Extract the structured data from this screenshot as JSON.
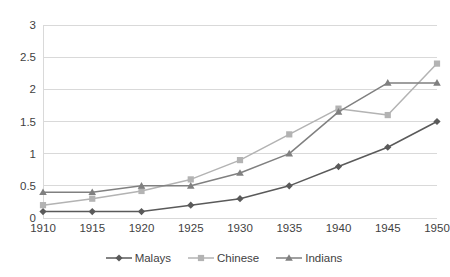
{
  "chart_data": {
    "type": "line",
    "title": "",
    "subtitle": "",
    "xlabel": "",
    "ylabel": "",
    "categories": [
      "1910",
      "1915",
      "1920",
      "1925",
      "1930",
      "1935",
      "1940",
      "1945",
      "1950"
    ],
    "x": [
      1910,
      1915,
      1920,
      1925,
      1930,
      1935,
      1940,
      1945,
      1950
    ],
    "ylim": [
      0,
      3
    ],
    "ytick_labels": [
      "0",
      "0.5",
      "1",
      "1.5",
      "2",
      "2.5",
      "3"
    ],
    "yticks": [
      0,
      0.5,
      1,
      1.5,
      2,
      2.5,
      3
    ],
    "grid": "horizontal",
    "legend_position": "bottom-center",
    "series": [
      {
        "name": "Malays",
        "color": "#5a5a5a",
        "marker": "diamond",
        "values": [
          0.1,
          0.1,
          0.1,
          0.2,
          0.3,
          0.5,
          0.8,
          1.1,
          1.5
        ]
      },
      {
        "name": "Chinese",
        "color": "#b3b3b3",
        "marker": "square",
        "values": [
          0.2,
          0.3,
          0.42,
          0.6,
          0.9,
          1.3,
          1.7,
          1.6,
          2.4
        ]
      },
      {
        "name": "Indians",
        "color": "#808080",
        "marker": "triangle",
        "values": [
          0.4,
          0.4,
          0.5,
          0.5,
          0.7,
          1.0,
          1.65,
          2.1,
          2.1
        ]
      }
    ]
  },
  "watermark": {
    "top_right": "",
    "center_right": ""
  },
  "colors": {
    "grid": "#d9d9d9",
    "axis_text": "#3f3f3f",
    "background": "#ffffff"
  }
}
